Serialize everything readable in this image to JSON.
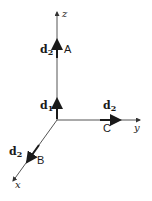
{
  "diagram": {
    "axes": {
      "z": {
        "label": "z"
      },
      "y": {
        "label": "y"
      },
      "x": {
        "label": "x"
      }
    },
    "vectors": [
      {
        "id": "A",
        "point_label": "A",
        "vector_label": "d",
        "vector_sub": "2",
        "along": "z"
      },
      {
        "id": "d1",
        "vector_label": "d",
        "vector_sub": "1",
        "along": "z",
        "at": "origin"
      },
      {
        "id": "C",
        "point_label": "C",
        "vector_label": "d",
        "vector_sub": "2",
        "along": "y"
      },
      {
        "id": "B",
        "point_label": "B",
        "vector_label": "d",
        "vector_sub": "2",
        "along": "x"
      }
    ],
    "colors": {
      "ink": "#1a1a1a",
      "axis": "#555555"
    }
  }
}
